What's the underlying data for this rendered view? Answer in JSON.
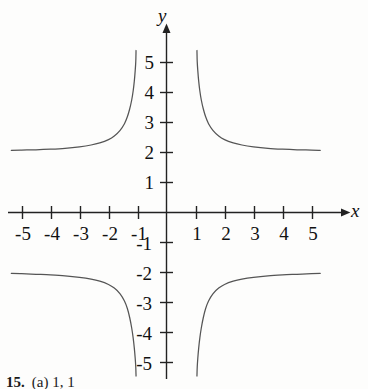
{
  "figure": {
    "background_color": "#fdfdfc",
    "curve_color": "#555555",
    "axis_color": "#222222",
    "text_color": "#111111",
    "caption_number": "15.",
    "caption_text": "(a) 1, 1"
  },
  "chart_data": {
    "type": "line",
    "title": "",
    "subtitle": "",
    "xlabel": "x",
    "ylabel": "y",
    "xlim": [
      -5.6,
      5.6
    ],
    "ylim": [
      -5.6,
      5.6
    ],
    "xticks": [
      -5,
      -4,
      -3,
      -2,
      -1,
      1,
      2,
      3,
      4,
      5
    ],
    "yticks": [
      -5,
      -4,
      -3,
      -2,
      -1,
      1,
      2,
      3,
      4,
      5
    ],
    "xtick_labels": [
      "-5",
      "-4",
      "-3",
      "-2",
      "-1",
      "1",
      "2",
      "3",
      "4",
      "5"
    ],
    "ytick_labels": [
      "-5",
      "-4",
      "-3",
      "-2",
      "-1",
      "1",
      "2",
      "3",
      "4",
      "5"
    ],
    "grid": false,
    "legend": "none",
    "axes_style": "arrowed-cross",
    "vertical_asymptotes": [
      -1,
      1
    ],
    "horizontal_asymptotes": [
      2,
      -2
    ],
    "series": [
      {
        "name": "upper-left-branch",
        "comment": "approaches y=2 from above as x decreases; rises to +5.4 near x=-1",
        "points": [
          [
            -5.35,
            2.07
          ],
          [
            -5.0,
            2.08
          ],
          [
            -4.5,
            2.09
          ],
          [
            -4.0,
            2.11
          ],
          [
            -3.5,
            2.14
          ],
          [
            -3.0,
            2.19
          ],
          [
            -2.6,
            2.25
          ],
          [
            -2.3,
            2.32
          ],
          [
            -2.0,
            2.43
          ],
          [
            -1.8,
            2.55
          ],
          [
            -1.6,
            2.74
          ],
          [
            -1.45,
            2.96
          ],
          [
            -1.35,
            3.19
          ],
          [
            -1.27,
            3.45
          ],
          [
            -1.2,
            3.75
          ],
          [
            -1.15,
            4.05
          ],
          [
            -1.11,
            4.38
          ],
          [
            -1.08,
            4.72
          ],
          [
            -1.06,
            5.02
          ],
          [
            -1.05,
            5.4
          ]
        ]
      },
      {
        "name": "upper-right-branch",
        "comment": "descends from +5.4 near x=1 and flattens toward y=2",
        "points": [
          [
            1.05,
            5.4
          ],
          [
            1.06,
            5.02
          ],
          [
            1.08,
            4.72
          ],
          [
            1.11,
            4.38
          ],
          [
            1.15,
            4.05
          ],
          [
            1.2,
            3.75
          ],
          [
            1.27,
            3.45
          ],
          [
            1.35,
            3.19
          ],
          [
            1.45,
            2.96
          ],
          [
            1.6,
            2.74
          ],
          [
            1.8,
            2.55
          ],
          [
            2.0,
            2.43
          ],
          [
            2.3,
            2.32
          ],
          [
            2.6,
            2.25
          ],
          [
            3.0,
            2.19
          ],
          [
            3.5,
            2.14
          ],
          [
            4.0,
            2.11
          ],
          [
            4.5,
            2.09
          ],
          [
            5.0,
            2.08
          ],
          [
            5.3,
            2.07
          ]
        ]
      },
      {
        "name": "lower-left-branch",
        "comment": "flat near y=-2 for very negative x; plunges to -5.4 near x=-1",
        "points": [
          [
            -5.35,
            -2.03
          ],
          [
            -5.0,
            -2.04
          ],
          [
            -4.5,
            -2.06
          ],
          [
            -4.0,
            -2.08
          ],
          [
            -3.5,
            -2.11
          ],
          [
            -3.0,
            -2.16
          ],
          [
            -2.6,
            -2.22
          ],
          [
            -2.3,
            -2.29
          ],
          [
            -2.0,
            -2.4
          ],
          [
            -1.8,
            -2.52
          ],
          [
            -1.6,
            -2.71
          ],
          [
            -1.45,
            -2.95
          ],
          [
            -1.35,
            -3.2
          ],
          [
            -1.27,
            -3.5
          ],
          [
            -1.2,
            -3.85
          ],
          [
            -1.15,
            -4.18
          ],
          [
            -1.11,
            -4.52
          ],
          [
            -1.08,
            -4.85
          ],
          [
            -1.06,
            -5.15
          ],
          [
            -1.05,
            -5.45
          ]
        ]
      },
      {
        "name": "lower-right-branch",
        "comment": "rises from -5.4 near x=1 and flattens toward y=-2",
        "points": [
          [
            1.05,
            -5.45
          ],
          [
            1.06,
            -5.15
          ],
          [
            1.08,
            -4.85
          ],
          [
            1.11,
            -4.52
          ],
          [
            1.15,
            -4.18
          ],
          [
            1.2,
            -3.85
          ],
          [
            1.27,
            -3.5
          ],
          [
            1.35,
            -3.2
          ],
          [
            1.45,
            -2.95
          ],
          [
            1.6,
            -2.71
          ],
          [
            1.8,
            -2.52
          ],
          [
            2.0,
            -2.4
          ],
          [
            2.3,
            -2.29
          ],
          [
            2.6,
            -2.22
          ],
          [
            3.0,
            -2.16
          ],
          [
            3.5,
            -2.11
          ],
          [
            4.0,
            -2.08
          ],
          [
            4.5,
            -2.06
          ],
          [
            5.0,
            -2.04
          ],
          [
            5.3,
            -2.03
          ]
        ]
      }
    ]
  }
}
